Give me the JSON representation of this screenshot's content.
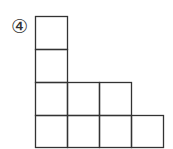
{
  "problem": {
    "number_label": "④"
  },
  "diagram": {
    "stroke_color": "#333333",
    "cell_size": 32,
    "rows": [
      1,
      1,
      3,
      4
    ]
  }
}
